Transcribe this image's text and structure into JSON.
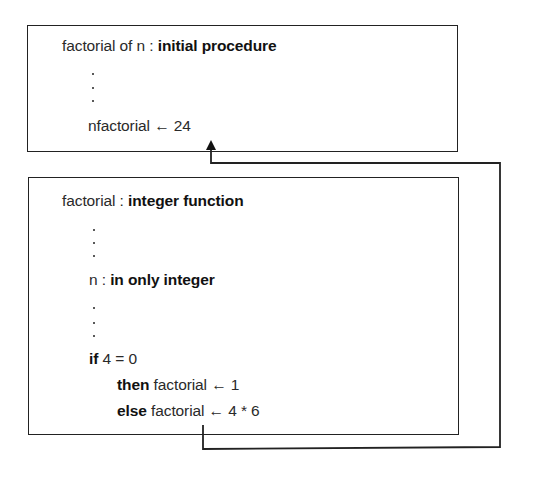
{
  "caller": {
    "header": {
      "name": "factorial of n",
      "sep": " : ",
      "kind": "initial procedure"
    },
    "assignment": {
      "target": "nfactorial",
      "arrow": "←",
      "value": "24"
    }
  },
  "callee": {
    "header": {
      "name": "factorial",
      "sep": " : ",
      "kind": "integer function"
    },
    "param": {
      "name": "n",
      "sep": " : ",
      "decl": "in only integer"
    },
    "if_line": {
      "keyword": "if",
      "cond": "4 = 0"
    },
    "then_line": {
      "keyword": "then",
      "target": "factorial",
      "arrow": "←",
      "value": "1"
    },
    "else_line": {
      "keyword": "else",
      "target": "factorial",
      "arrow": "←",
      "value": "4 * 6"
    }
  },
  "connector": {
    "description": "return value flows from else-branch factorial back to nfactorial",
    "color": "#222222"
  }
}
